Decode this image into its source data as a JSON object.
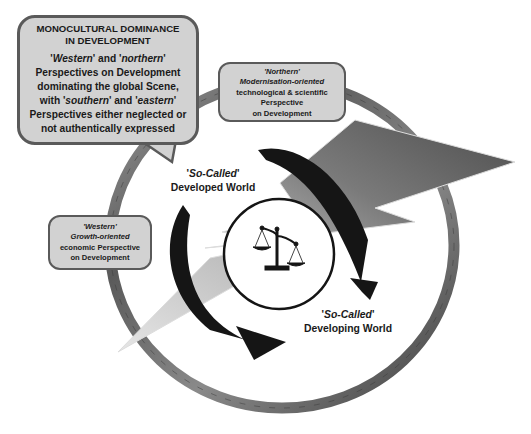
{
  "diagram": {
    "main_callout": {
      "title_line1": "MONOCULTURAL DOMINANCE",
      "title_line2": "IN DEVELOPMENT",
      "line1_q1": "'",
      "line1_w1": "Western",
      "line1_mid": "' and '",
      "line1_w2": "northern",
      "line1_q2": "'",
      "line2": "Perspectives on Development",
      "line3": "dominating the global Scene,",
      "line4_pre": "with '",
      "line4_w1": "southern",
      "line4_mid": "' and '",
      "line4_w2": "eastern",
      "line4_q2": "'",
      "line5": "Perspectives either neglected or",
      "line6": "not authentically expressed"
    },
    "northern_box": {
      "line1": "'Northern'",
      "line2": "Modernisation-oriented",
      "line3": "technological & scientific",
      "line4": "Perspective",
      "line5": "on Development"
    },
    "western_box": {
      "line1": "'Western'",
      "line2": "Growth-oriented",
      "line3": "economic Perspective",
      "line4": "on Development"
    },
    "developed_world": {
      "prefix": "'",
      "italic": "So-Called",
      "suffix": "'",
      "line2": "Developed World"
    },
    "developing_world": {
      "prefix": "'",
      "italic": "So-Called",
      "suffix": "'",
      "line2": "Developing World"
    },
    "icons": {
      "center": "scales-of-justice-icon",
      "ring": "globe-ring",
      "bolt": "lightning-bolt",
      "arrows": "cycle-arrows"
    },
    "colors": {
      "box_fill": "#d2d2d2",
      "box_border": "#5a5a5a",
      "bolt_dark": "#5e5e5e",
      "bolt_light": "#d8d8d8",
      "ring_dark": "#4a4a4a",
      "ring_light": "#9a9a9a",
      "arrow": "#151515"
    }
  }
}
